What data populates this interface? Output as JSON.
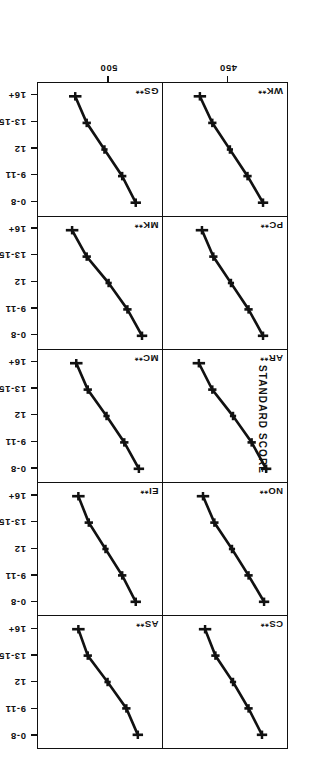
{
  "figure": {
    "value_axis_title": "STANDARD SCORE",
    "value_axis_ticks": [
      450,
      500
    ],
    "value_axis_tick_labels": [
      "450",
      "500"
    ],
    "category_axis_ticks": [
      "0-8",
      "9-11",
      "12",
      "13-15",
      "16+"
    ]
  },
  "chart_data": {
    "type": "line",
    "title": "",
    "xlabel": "",
    "ylabel": "STANDARD SCORE",
    "categories": [
      "0-8",
      "9-11",
      "12",
      "13-15",
      "16+"
    ],
    "xlim": [
      425,
      530
    ],
    "ylim": [
      425,
      530
    ],
    "grid": false,
    "legend": "none",
    "error_bars": true,
    "panel_layout": {
      "rows": 5,
      "cols": 2
    },
    "panels": [
      {
        "label": "CS**",
        "row": 0,
        "col": 0,
        "values": [
          442,
          455,
          470,
          487,
          497
        ],
        "errors": [
          5,
          4,
          3,
          4,
          6
        ]
      },
      {
        "label": "AS**",
        "row": 0,
        "col": 1,
        "values": [
          441,
          452,
          470,
          489,
          498
        ],
        "errors": [
          5,
          4,
          3,
          4,
          6
        ]
      },
      {
        "label": "NO**",
        "row": 1,
        "col": 0,
        "values": [
          440,
          455,
          471,
          488,
          499
        ],
        "errors": [
          5,
          4,
          3,
          4,
          6
        ]
      },
      {
        "label": "EI**",
        "row": 1,
        "col": 1,
        "values": [
          443,
          456,
          472,
          488,
          498
        ],
        "errors": [
          5,
          4,
          3,
          4,
          6
        ]
      },
      {
        "label": "AR**",
        "row": 2,
        "col": 0,
        "values": [
          438,
          452,
          470,
          490,
          503
        ],
        "errors": [
          5,
          4,
          3,
          4,
          6
        ]
      },
      {
        "label": "MC**",
        "row": 2,
        "col": 1,
        "values": [
          440,
          454,
          471,
          489,
          500
        ],
        "errors": [
          5,
          4,
          3,
          4,
          6
        ]
      },
      {
        "label": "PC**",
        "row": 3,
        "col": 0,
        "values": [
          441,
          455,
          472,
          489,
          500
        ],
        "errors": [
          5,
          4,
          3,
          4,
          6
        ]
      },
      {
        "label": "MK**",
        "row": 3,
        "col": 1,
        "values": [
          437,
          451,
          469,
          490,
          504
        ],
        "errors": [
          5,
          4,
          3,
          4,
          6
        ]
      },
      {
        "label": "WK**",
        "row": 4,
        "col": 0,
        "values": [
          441,
          456,
          473,
          490,
          502
        ],
        "errors": [
          5,
          4,
          3,
          4,
          6
        ]
      },
      {
        "label": "GS**",
        "row": 4,
        "col": 1,
        "values": [
          443,
          456,
          473,
          490,
          501
        ],
        "errors": [
          5,
          4,
          3,
          4,
          6
        ]
      }
    ]
  }
}
